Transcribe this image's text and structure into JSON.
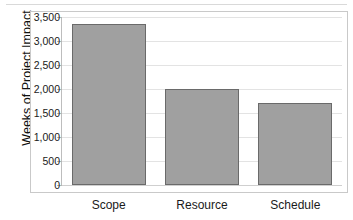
{
  "artifact": {
    "ghost_text": ""
  },
  "chart_data": {
    "type": "bar",
    "title": "",
    "xlabel": "",
    "ylabel": "Weeks of Project Impact",
    "categories": [
      "Scope",
      "Resource",
      "Schedule"
    ],
    "values": [
      3350,
      2000,
      1700
    ],
    "ylim": [
      0,
      3500
    ],
    "ytick_values": [
      0,
      500,
      1000,
      1500,
      2000,
      2500,
      3000,
      3500
    ],
    "ytick_labels": [
      "0",
      "500",
      "1,000",
      "1,500",
      "2,000",
      "2,500",
      "3,000",
      "3,500"
    ],
    "grid": true,
    "legend": false,
    "colors": {
      "bar_fill": "#a0a0a0",
      "bar_border": "#6a6a6a",
      "gridline": "#e3e3e3",
      "axis": "#bdbdbd",
      "frame": "#c9c9c9",
      "text": "#1a1a1a",
      "background": "#ffffff"
    }
  }
}
